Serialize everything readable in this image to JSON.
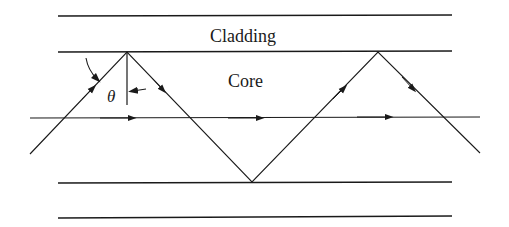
{
  "diagram": {
    "type": "optical-fiber-ray-propagation",
    "labels": {
      "cladding": "Cladding",
      "core": "Core",
      "angle": "θ"
    },
    "colors": {
      "ink": "#1a1a1a",
      "background": "#ffffff"
    }
  }
}
